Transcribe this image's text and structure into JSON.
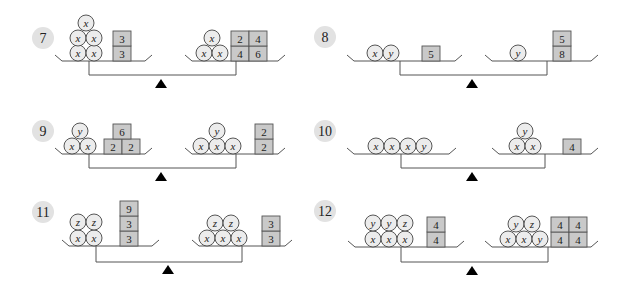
{
  "problems": [
    {
      "number": "7",
      "left": {
        "balls": [
          [
            "x",
            "x"
          ],
          [
            "x",
            "x"
          ],
          [
            "x"
          ]
        ],
        "blocks": [
          [
            "3"
          ],
          [
            "3"
          ]
        ]
      },
      "right": {
        "balls": [
          [
            "x",
            "x"
          ],
          [
            "x"
          ]
        ],
        "blocks": [
          [
            "4",
            "6"
          ],
          [
            "2",
            "4"
          ]
        ]
      }
    },
    {
      "number": "8",
      "left": {
        "balls": [
          [
            "x",
            "y"
          ]
        ],
        "blocks": [
          [
            "5"
          ]
        ]
      },
      "right": {
        "balls": [
          [
            "y"
          ]
        ],
        "blocks": [
          [
            "8"
          ],
          [
            "5"
          ]
        ]
      }
    },
    {
      "number": "9",
      "left": {
        "balls": [
          [
            "x",
            "x"
          ],
          [
            "y"
          ]
        ],
        "blocks": [
          [
            "2",
            "2"
          ],
          [
            "6"
          ]
        ]
      },
      "right": {
        "balls": [
          [
            "x",
            "x",
            "x"
          ],
          [
            "y"
          ]
        ],
        "blocks": [
          [
            "2"
          ],
          [
            "2"
          ]
        ]
      }
    },
    {
      "number": "10",
      "left": {
        "balls": [
          [
            "x",
            "x",
            "x",
            "y"
          ]
        ],
        "blocks": []
      },
      "right": {
        "balls": [
          [
            "x",
            "x"
          ],
          [
            "y"
          ]
        ],
        "blocks": [
          [
            "4"
          ]
        ]
      }
    },
    {
      "number": "11",
      "left": {
        "balls": [
          [
            "x",
            "x"
          ],
          [
            "z",
            "z"
          ]
        ],
        "blocks": [
          [
            "3"
          ],
          [
            "3"
          ],
          [
            "9"
          ]
        ],
        "square_stack": true
      },
      "right": {
        "balls": [
          [
            "x",
            "x",
            "x"
          ],
          [
            "z",
            "z"
          ]
        ],
        "blocks": [
          [
            "3"
          ],
          [
            "3"
          ]
        ]
      }
    },
    {
      "number": "12",
      "left": {
        "balls": [
          [
            "x",
            "x",
            "x"
          ],
          [
            "y",
            "y",
            "z"
          ]
        ],
        "blocks": [
          [
            "4"
          ],
          [
            "4"
          ]
        ],
        "square_stack": true
      },
      "right": {
        "balls": [
          [
            "x",
            "x",
            "y"
          ],
          [
            "y",
            "z"
          ]
        ],
        "blocks": [
          [
            "4",
            "4"
          ],
          [
            "4",
            "4"
          ]
        ]
      }
    }
  ]
}
